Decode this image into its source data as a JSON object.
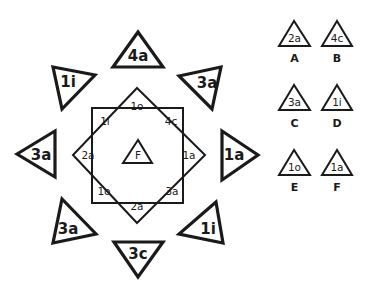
{
  "puzzle": {
    "center": {
      "label": "F"
    },
    "outer_ring": [
      {
        "position": "top",
        "label": "4a"
      },
      {
        "position": "top-right",
        "label": "3a"
      },
      {
        "position": "right",
        "label": "1a"
      },
      {
        "position": "bottom-right",
        "label": "1i"
      },
      {
        "position": "bottom",
        "label": "3c"
      },
      {
        "position": "bottom-left",
        "label": "3a"
      },
      {
        "position": "left",
        "label": "3a"
      },
      {
        "position": "top-left",
        "label": "1i"
      }
    ],
    "inner_star": [
      {
        "position": "top",
        "label": "1o"
      },
      {
        "position": "top-right",
        "label": "4c"
      },
      {
        "position": "right",
        "label": "1a"
      },
      {
        "position": "bottom-right",
        "label": "3a"
      },
      {
        "position": "bottom",
        "label": "2a"
      },
      {
        "position": "bottom-left",
        "label": "1o"
      },
      {
        "position": "left",
        "label": "2a"
      },
      {
        "position": "top-left",
        "label": "1i"
      }
    ]
  },
  "options": [
    {
      "letter": "A",
      "label": "2a"
    },
    {
      "letter": "B",
      "label": "4c"
    },
    {
      "letter": "C",
      "label": "3a"
    },
    {
      "letter": "D",
      "label": "1i"
    },
    {
      "letter": "E",
      "label": "1o"
    },
    {
      "letter": "F",
      "label": "1a"
    }
  ],
  "colors": {
    "stroke": "#1a1a1a",
    "background": "#ffffff"
  }
}
